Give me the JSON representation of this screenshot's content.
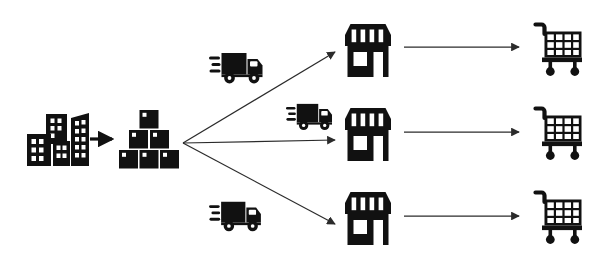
{
  "diagram": {
    "type": "flow-diagram",
    "canvas": {
      "width": 610,
      "height": 261
    },
    "colors": {
      "ink": "#111111",
      "background": "#ffffff",
      "arrow": "#2b2b2b"
    },
    "stages": [
      {
        "id": "origin",
        "icon": "city-buildings-icon",
        "label": "Manufacturing city"
      },
      {
        "id": "inventory",
        "icon": "stacked-boxes-icon",
        "label": "Warehouse inventory"
      },
      {
        "id": "transport",
        "icon": "delivery-truck-icon",
        "label": "Delivery truck"
      },
      {
        "id": "retail",
        "icon": "storefront-icon",
        "label": "Retail store"
      },
      {
        "id": "consumer",
        "icon": "shopping-cart-icon",
        "label": "Consumer cart"
      }
    ],
    "nodes": {
      "city": {
        "name": "city-buildings-icon",
        "x": 27,
        "y": 110,
        "w": 58,
        "h": 56
      },
      "boxes": {
        "name": "stacked-boxes-icon",
        "x": 119,
        "y": 110,
        "w": 60,
        "h": 58
      },
      "trucks": [
        {
          "name": "delivery-truck-icon-top",
          "x": 209,
          "y": 45,
          "w": 56,
          "h": 40
        },
        {
          "name": "delivery-truck-icon-middle",
          "x": 286,
          "y": 97,
          "w": 48,
          "h": 34
        },
        {
          "name": "delivery-truck-icon-bottom",
          "x": 209,
          "y": 194,
          "w": 54,
          "h": 39
        }
      ],
      "stores": [
        {
          "name": "storefront-icon-top",
          "x": 342,
          "y": 22,
          "w": 52,
          "h": 56
        },
        {
          "name": "storefront-icon-middle",
          "x": 342,
          "y": 106,
          "w": 52,
          "h": 56
        },
        {
          "name": "storefront-icon-bottom",
          "x": 342,
          "y": 190,
          "w": 52,
          "h": 56
        }
      ],
      "carts": [
        {
          "name": "shopping-cart-icon-top",
          "x": 528,
          "y": 22,
          "w": 56,
          "h": 54
        },
        {
          "name": "shopping-cart-icon-middle",
          "x": 528,
          "y": 106,
          "w": 56,
          "h": 54
        },
        {
          "name": "shopping-cart-icon-bottom",
          "x": 528,
          "y": 190,
          "w": 56,
          "h": 54
        }
      ]
    },
    "connections": [
      {
        "id": "city-to-boxes",
        "name": "arrow-city-to-boxes",
        "from": "city",
        "to": "boxes",
        "style": "thick-short",
        "x1": 90,
        "y1": 139,
        "x2": 113,
        "y2": 139
      },
      {
        "id": "hub-to-store-top",
        "name": "arrow-hub-to-store-top",
        "from": "boxes",
        "to": "storefront-icon-top",
        "style": "diagonal-up",
        "x1": 183,
        "y1": 143,
        "x2": 336,
        "y2": 52
      },
      {
        "id": "hub-to-store-middle",
        "name": "arrow-hub-to-store-middle",
        "from": "boxes",
        "to": "storefront-icon-middle",
        "style": "horizontal",
        "x1": 183,
        "y1": 143,
        "x2": 336,
        "y2": 140
      },
      {
        "id": "hub-to-store-bottom",
        "name": "arrow-hub-to-store-bottom",
        "from": "boxes",
        "to": "storefront-icon-bottom",
        "style": "diagonal-down",
        "x1": 183,
        "y1": 143,
        "x2": 336,
        "y2": 224
      },
      {
        "id": "store-to-cart-top",
        "name": "arrow-store-to-cart-top",
        "from": "storefront-icon-top",
        "to": "shopping-cart-icon-top",
        "style": "horizontal",
        "x1": 404,
        "y1": 47,
        "x2": 520,
        "y2": 47
      },
      {
        "id": "store-to-cart-middle",
        "name": "arrow-store-to-cart-middle",
        "from": "storefront-icon-middle",
        "to": "shopping-cart-icon-middle",
        "style": "horizontal",
        "x1": 404,
        "y1": 132,
        "x2": 520,
        "y2": 132
      },
      {
        "id": "store-to-cart-bottom",
        "name": "arrow-store-to-cart-bottom",
        "from": "storefront-icon-bottom",
        "to": "shopping-cart-icon-bottom",
        "style": "horizontal",
        "x1": 404,
        "y1": 216,
        "x2": 520,
        "y2": 216
      }
    ],
    "icon_details": {
      "city": {
        "building_count": 4,
        "has_window_grid": true
      },
      "boxes": {
        "rows": [
          1,
          2,
          3
        ],
        "total": 6,
        "label_mark": "corner-square"
      },
      "truck": {
        "parts": [
          "cargo-box",
          "cab",
          "window",
          "two-wheels",
          "motion-lines"
        ],
        "motion_line_count": 3
      },
      "store": {
        "awning_stripes": 4,
        "has_door": true,
        "has_window": true
      },
      "cart": {
        "basket_columns": 4,
        "basket_rows": 3,
        "wheel_count": 2,
        "has_handle": true
      }
    }
  }
}
